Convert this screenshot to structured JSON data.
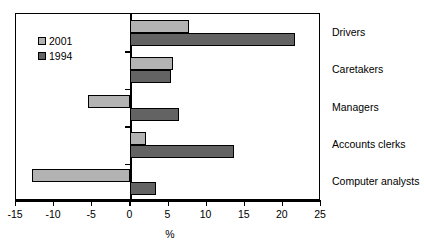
{
  "chart_data": {
    "type": "bar",
    "orientation": "horizontal",
    "title": "",
    "xlabel": "%",
    "ylabel": "",
    "xlim": [
      -15,
      25
    ],
    "xticks": [
      -15,
      -10,
      -5,
      0,
      5,
      10,
      15,
      20,
      25
    ],
    "xtick_labels": [
      "-15",
      "-10",
      "-5",
      "0",
      "5",
      "10",
      "15",
      "20",
      "25"
    ],
    "grid": false,
    "legend_position": "upper left",
    "categories": [
      "Drivers",
      "Caretakers",
      "Managers",
      "Accounts clerks",
      "Computer analysts"
    ],
    "series": [
      {
        "name": "2001",
        "color": "#b3b3b3",
        "values": [
          7.7,
          5.6,
          -5.6,
          2.0,
          -12.9
        ]
      },
      {
        "name": "1994",
        "color": "#636363",
        "values": [
          21.6,
          5.3,
          6.4,
          13.6,
          3.3
        ]
      }
    ]
  },
  "legend": {
    "entries": [
      {
        "label": "2001"
      },
      {
        "label": "1994"
      }
    ]
  },
  "axis": {
    "x_title": "%",
    "tick_labels": [
      "-15",
      "-10",
      "-5",
      "0",
      "5",
      "10",
      "15",
      "20",
      "25"
    ]
  },
  "categories": [
    {
      "label": "Drivers"
    },
    {
      "label": "Caretakers"
    },
    {
      "label": "Managers"
    },
    {
      "label": "Accounts clerks"
    },
    {
      "label": "Computer analysts"
    }
  ]
}
